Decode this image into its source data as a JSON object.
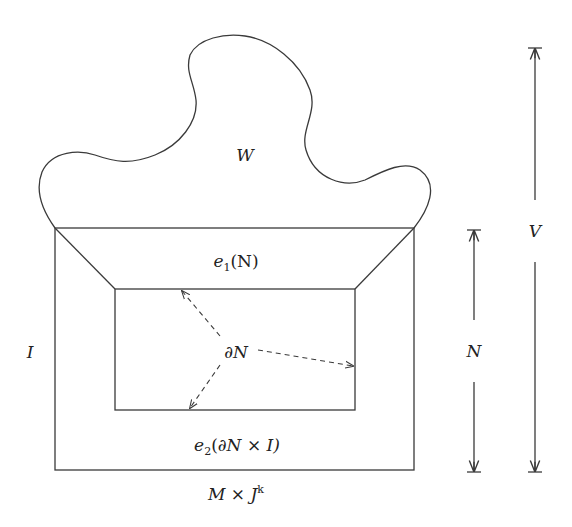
{
  "diagram": {
    "labels": {
      "W": "W",
      "e1": "e",
      "e1_sub": "1",
      "e1_arg": "(N)",
      "dN": "∂N",
      "I_left": "I",
      "e2": "e",
      "e2_sub": "2",
      "e2_arg_open": "(∂N ",
      "e2_times": "×",
      "e2_arg_close": " I)",
      "M": "M ",
      "M_times": "×",
      "J": " J",
      "J_sup": "k",
      "N": "N",
      "V": "V"
    },
    "regions": [
      {
        "name": "W",
        "shape": "blob"
      },
      {
        "name": "e1(N)",
        "shape": "trapezoid"
      },
      {
        "name": "∂N",
        "shape": "inner-rectangle"
      },
      {
        "name": "e2(∂N × I)",
        "shape": "outer-band"
      },
      {
        "name": "M × J^k",
        "shape": "outer-rectangle"
      }
    ],
    "dimension_arrows": [
      {
        "label": "N",
        "span": "outer rectangle height"
      },
      {
        "label": "V",
        "span": "full height including W"
      }
    ],
    "colors": {
      "stroke": "#3a3a3a",
      "text": "#222222",
      "background": "#ffffff"
    }
  }
}
